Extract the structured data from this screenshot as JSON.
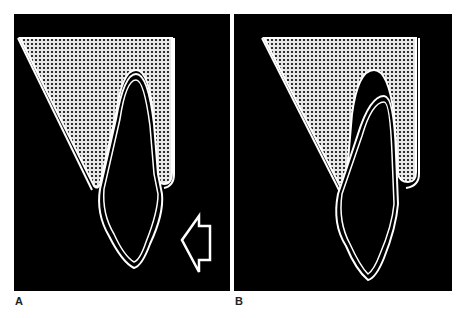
{
  "figure": {
    "panels": [
      {
        "id": "A",
        "label": "A",
        "description": "Tooth in normal position within alveolar bone (stippled), with arrow indicating lingual/palatal force direction",
        "arrow": {
          "present": true,
          "direction": "left"
        }
      },
      {
        "id": "B",
        "label": "B",
        "description": "Tooth tipped/displaced after force, crown moved, root shifted within socket",
        "arrow": {
          "present": false
        }
      }
    ],
    "colors": {
      "background": "#000000",
      "outline": "#ffffff",
      "bone_fill": "#e8e8e8",
      "bone_dots": "#000000",
      "page": "#ffffff"
    }
  }
}
